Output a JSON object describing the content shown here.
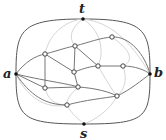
{
  "diagram": {
    "type": "planar-graph",
    "terminals": {
      "t": {
        "label": "t",
        "x": 83,
        "y": 19
      },
      "a": {
        "label": "a",
        "x": 16,
        "y": 74
      },
      "b": {
        "label": "b",
        "x": 150,
        "y": 74
      },
      "s": {
        "label": "s",
        "x": 84,
        "y": 124
      }
    },
    "inner_nodes": [
      {
        "id": "n1",
        "x": 45,
        "y": 54
      },
      {
        "id": "n2",
        "x": 75,
        "y": 46
      },
      {
        "id": "n3",
        "x": 112,
        "y": 37
      },
      {
        "id": "n4",
        "x": 74,
        "y": 72
      },
      {
        "id": "n5",
        "x": 98,
        "y": 66
      },
      {
        "id": "n6",
        "x": 123,
        "y": 66
      },
      {
        "id": "n7",
        "x": 45,
        "y": 88
      },
      {
        "id": "n8",
        "x": 78,
        "y": 87
      },
      {
        "id": "n9",
        "x": 117,
        "y": 96
      },
      {
        "id": "n10",
        "x": 67,
        "y": 105
      }
    ],
    "colors": {
      "dark_edge": "#555555",
      "light_edge": "#c8c8c8",
      "node_fill": "#ffffff",
      "node_stroke": "#444444",
      "terminal": "#111111"
    }
  }
}
